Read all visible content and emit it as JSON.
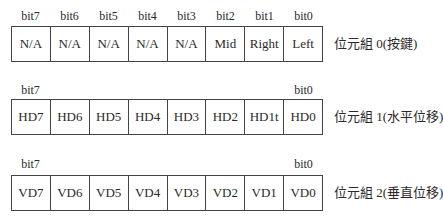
{
  "rows": [
    {
      "bit_labels": [
        "bit7",
        "bit6",
        "bit5",
        "bit4",
        "bit3",
        "bit2",
        "bit1",
        "bit0"
      ],
      "cells": [
        "N/A",
        "N/A",
        "N/A",
        "N/A",
        "N/A",
        "Mid",
        "Right",
        "Left"
      ],
      "caption": "位元組 0(按鍵)"
    },
    {
      "bit_labels": [
        "bit7",
        "",
        "",
        "",
        "",
        "",
        "",
        "bit0"
      ],
      "cells": [
        "HD7",
        "HD6",
        "HD5",
        "HD4",
        "HD3",
        "HD2",
        "HD1t",
        "HD0"
      ],
      "caption": "位元組 1(水平位移)"
    },
    {
      "bit_labels": [
        "bit7",
        "",
        "",
        "",
        "",
        "",
        "",
        "bit0"
      ],
      "cells": [
        "VD7",
        "VD6",
        "VD5",
        "VD4",
        "VD3",
        "VD2",
        "VD1",
        "VD0"
      ],
      "caption": "位元組 2(垂直位移)"
    }
  ]
}
